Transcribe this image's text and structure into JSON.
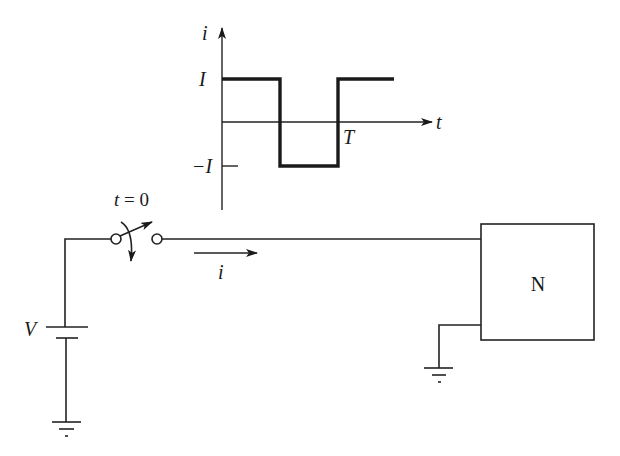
{
  "waveform_graph": {
    "y_axis_label": "i",
    "x_axis_label": "t",
    "level_high_label": "I",
    "level_low_label": "−I",
    "period_label": "T",
    "waveform": "square wave: +I from 0 to T/2, −I from T/2 to T, then +I"
  },
  "circuit": {
    "source_label": "V",
    "switch_label": "t = 0",
    "current_label": "i",
    "network_label": "N",
    "ground_symbols": 2
  },
  "colors": {
    "line": "#222222",
    "background": "#ffffff"
  }
}
